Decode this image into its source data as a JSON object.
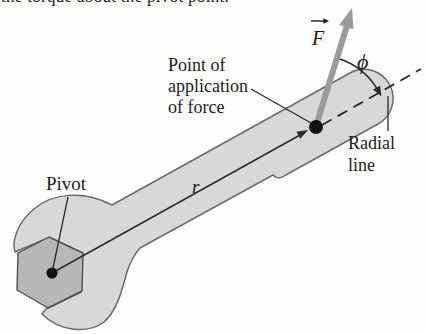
{
  "figure": {
    "cropped_top_text": "the torque about the pivot point.",
    "labels": {
      "pivot": "Pivot",
      "point_of_application_line1": "Point of",
      "point_of_application_line2": "application",
      "point_of_application_line3": "of force",
      "radial_line_line1": "Radial",
      "radial_line_line2": "line",
      "radius_symbol": "r",
      "force_symbol": "F",
      "angle_symbol": "ϕ"
    },
    "colors": {
      "background": "#fdfdfc",
      "wrench_fill": "#d8d8d8",
      "wrench_outline": "#6a6a6a",
      "nut_fill": "#b7b7b7",
      "nut_outline": "#4f4f4f",
      "force_arrow": "#9b9b9b",
      "line_color": "#2b2b2b",
      "text_color": "#1c1c1c"
    }
  }
}
